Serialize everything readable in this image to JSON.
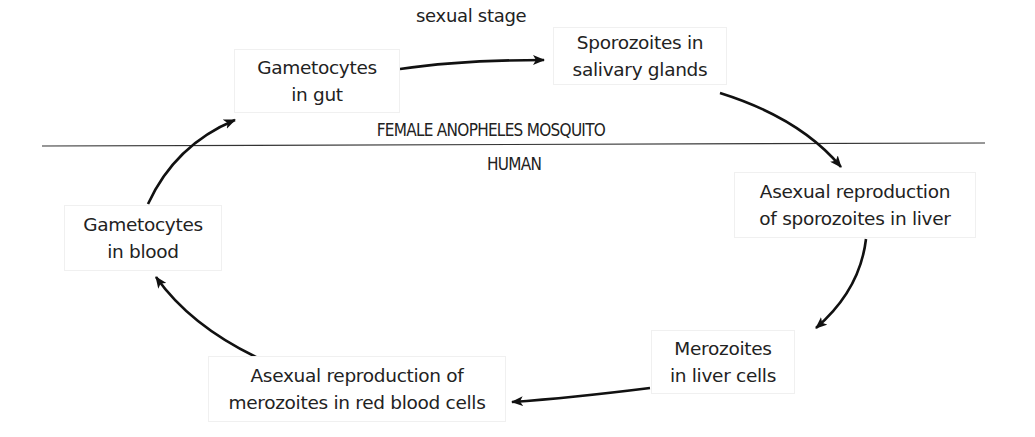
{
  "diagram": {
    "regions": {
      "mosquito": "FEMALE ANOPHELES MOSQUITO",
      "human": "HUMAN"
    },
    "edge_labels": {
      "sexual_stage": "sexual stage"
    },
    "nodes": [
      {
        "id": "gametocytes-gut",
        "lines": [
          "Gametocytes",
          "in gut"
        ],
        "region": "mosquito"
      },
      {
        "id": "sporozoites-salivary",
        "lines": [
          "Sporozoites in",
          "salivary glands"
        ],
        "region": "mosquito"
      },
      {
        "id": "asexual-sporozoites-liver",
        "lines": [
          "Asexual reproduction",
          "of sporozoites in liver"
        ],
        "region": "human"
      },
      {
        "id": "merozoites-liver-cells",
        "lines": [
          "Merozoites",
          "in liver cells"
        ],
        "region": "human"
      },
      {
        "id": "asexual-merozoites-rbc",
        "lines": [
          "Asexual reproduction of",
          "merozoites in red blood cells"
        ],
        "region": "human"
      },
      {
        "id": "gametocytes-blood",
        "lines": [
          "Gametocytes",
          "in blood"
        ],
        "region": "human"
      }
    ],
    "edges": [
      {
        "from": "gametocytes-gut",
        "to": "sporozoites-salivary",
        "label": "sexual stage"
      },
      {
        "from": "sporozoites-salivary",
        "to": "asexual-sporozoites-liver"
      },
      {
        "from": "asexual-sporozoites-liver",
        "to": "merozoites-liver-cells"
      },
      {
        "from": "merozoites-liver-cells",
        "to": "asexual-merozoites-rbc"
      },
      {
        "from": "asexual-merozoites-rbc",
        "to": "gametocytes-blood"
      },
      {
        "from": "gametocytes-blood",
        "to": "gametocytes-gut"
      }
    ],
    "colors": {
      "stroke": "#111111",
      "text": "#222222",
      "divider": "#333333",
      "box_border": "#f0f0f0"
    }
  }
}
